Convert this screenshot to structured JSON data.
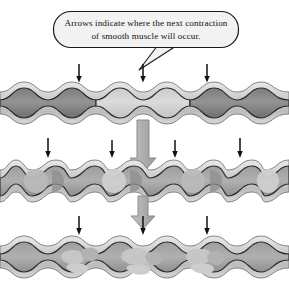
{
  "figure": {
    "background_color": "#ffffff"
  },
  "callout": {
    "name": "callout-bubble",
    "line1": "Arrows indicate where the next contraction",
    "line2": "of smooth muscle will occur.",
    "fill_color": "#f2f2f2",
    "stroke_color": "#1a1a1a",
    "text_color": "#111111",
    "box": {
      "x": 53,
      "y": 11,
      "width": 186,
      "height": 37,
      "radius": 18
    },
    "tail": {
      "from_x": 160,
      "from_y": 47,
      "tip_x": 139,
      "tip_y": 69,
      "to_x": 172,
      "to_y": 50
    }
  },
  "stages": [
    {
      "id": "stage-1",
      "label": "Stage 1 tube",
      "y_center": 103,
      "tube_half_height": 21,
      "phase_offset": 0,
      "bulge_centers": [
        48,
        143,
        237
      ],
      "neck_centers": [
        96,
        190
      ],
      "content_shades": [
        "dark",
        "light",
        "dark"
      ],
      "thin_arrows": [
        79,
        143,
        207
      ],
      "arrow_y_top": 64,
      "arrow_y_bottom": 81
    },
    {
      "id": "stage-2",
      "label": "Stage 2 tube",
      "y_center": 181,
      "tube_half_height": 21,
      "phase_offset": 0.5,
      "bulge_centers": [
        32,
        110,
        190,
        265
      ],
      "neck_centers": [
        71,
        150,
        228
      ],
      "content_shades": [
        "split",
        "split",
        "split",
        "split"
      ],
      "thin_arrows": [
        48,
        112,
        175,
        240
      ],
      "arrow_y_top": 136,
      "arrow_y_bottom": 158
    },
    {
      "id": "stage-3",
      "label": "Stage 3 tube",
      "y_center": 257,
      "tube_half_height": 21,
      "phase_offset": 0,
      "bulge_centers": [
        79,
        143,
        207
      ],
      "neck_centers": [
        111,
        175
      ],
      "content_shades": [
        "mottled",
        "mottled",
        "mottled"
      ],
      "thin_arrows": [
        79,
        143,
        207
      ],
      "arrow_y_top": 213,
      "arrow_y_bottom": 233
    }
  ],
  "block_arrows": [
    {
      "name": "block-arrow-1-to-2",
      "x": 143,
      "y_top": 120,
      "y_bottom": 172,
      "shaft_width": 12,
      "head_width": 26
    },
    {
      "name": "block-arrow-2-to-3",
      "x": 143,
      "y_top": 196,
      "y_bottom": 228,
      "shaft_width": 11,
      "head_width": 24
    }
  ],
  "colors": {
    "tube_wall_outer": "#c9c9c9",
    "tube_wall_inner": "#e6e6e6",
    "tube_outline": "#2b2b2b",
    "lumen_dark": "#8a8a8a",
    "lumen_mid": "#a3a3a3",
    "lumen_light": "#cfcfcf",
    "lumen_lighter": "#dcdcdc",
    "block_arrow_fill": "#b5b5b5",
    "block_arrow_stroke": "#6e6e6e",
    "thin_arrow": "#111111"
  },
  "thin_arrow_style": {
    "name": "thin-down-arrow",
    "stroke_width": 1.5,
    "head_half_width": 2.6,
    "head_length": 5
  }
}
